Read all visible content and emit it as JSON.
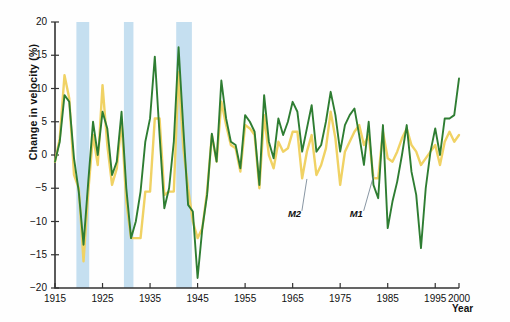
{
  "chart_data": {
    "type": "line",
    "title": "",
    "xlabel": "Year",
    "ylabel": "Change in velocity (%)",
    "xlim": [
      1915,
      2000
    ],
    "ylim": [
      -20,
      20
    ],
    "grid": false,
    "legend_position": "inline-annotation",
    "x_ticks": [
      "1915",
      "1925",
      "1935",
      "1945",
      "1955",
      "1965",
      "1975",
      "1985",
      "1995",
      "2000"
    ],
    "x_tick_values": [
      1915,
      1925,
      1935,
      1945,
      1955,
      1965,
      1975,
      1985,
      1995,
      2000
    ],
    "y_ticks": [
      "20",
      "15",
      "10",
      "5",
      "0",
      "-5",
      "-10",
      "-15",
      "-20"
    ],
    "y_tick_values": [
      20,
      15,
      10,
      5,
      0,
      -5,
      -10,
      -15,
      -20
    ],
    "colors": {
      "M1": "#2e7d32",
      "M2": "#f0d264",
      "recession_band": "#c5dff0",
      "axis": "#333333",
      "text": "#111111"
    },
    "annotations": [
      {
        "text": "M2",
        "x": 1964,
        "y": -9.0,
        "leader_to_x": 1968,
        "leader_to_y": -3.6
      },
      {
        "text": "M1",
        "x": 1977,
        "y": -9.0,
        "leader_to_x": 1982,
        "leader_to_y": -3.2
      }
    ],
    "shaded_bands": [
      {
        "x0": 1919.5,
        "x1": 1922.2,
        "label": ""
      },
      {
        "x0": 1929.5,
        "x1": 1931.5,
        "label": ""
      },
      {
        "x0": 1940.5,
        "x1": 1943.8,
        "label": ""
      }
    ],
    "x": [
      1915,
      1916,
      1917,
      1918,
      1919,
      1920,
      1921,
      1922,
      1923,
      1924,
      1925,
      1926,
      1927,
      1928,
      1929,
      1930,
      1931,
      1932,
      1933,
      1934,
      1935,
      1936,
      1937,
      1938,
      1939,
      1940,
      1941,
      1942,
      1943,
      1944,
      1945,
      1946,
      1947,
      1948,
      1949,
      1950,
      1951,
      1952,
      1953,
      1954,
      1955,
      1956,
      1957,
      1958,
      1959,
      1960,
      1961,
      1962,
      1963,
      1964,
      1965,
      1966,
      1967,
      1968,
      1969,
      1970,
      1971,
      1972,
      1973,
      1974,
      1975,
      1976,
      1977,
      1978,
      1979,
      1980,
      1981,
      1982,
      1983,
      1984,
      1985,
      1986,
      1987,
      1988,
      1989,
      1990,
      1991,
      1992,
      1993,
      1994,
      1995,
      1996,
      1997,
      1998,
      1999,
      2000
    ],
    "series": [
      {
        "name": "M1",
        "color": "#2e7d32",
        "values": [
          -1.0,
          2.0,
          9.0,
          8.0,
          -0.5,
          -5.5,
          -13.5,
          -4.0,
          5.0,
          0.0,
          6.5,
          4.0,
          -3.0,
          -1.0,
          6.5,
          -5.0,
          -12.5,
          -10.0,
          -5.5,
          2.0,
          5.5,
          14.8,
          3.0,
          -8.0,
          -5.0,
          2.0,
          16.2,
          4.0,
          -7.5,
          -8.5,
          -18.5,
          -11.0,
          -6.0,
          3.2,
          -1.0,
          11.2,
          5.5,
          2.0,
          1.5,
          -2.0,
          6.0,
          5.0,
          3.5,
          -4.5,
          9.0,
          2.0,
          -0.5,
          5.5,
          3.0,
          5.0,
          8.0,
          6.5,
          0.5,
          4.0,
          7.5,
          0.5,
          1.5,
          5.0,
          9.5,
          6.0,
          0.5,
          4.5,
          6.0,
          7.0,
          3.0,
          -1.5,
          5.0,
          -4.5,
          -6.5,
          4.5,
          -11.0,
          -7.0,
          -4.0,
          0.0,
          4.5,
          -2.5,
          -6.0,
          -14.0,
          -5.0,
          0.5,
          4.0,
          0.0,
          5.5,
          5.5,
          6.0,
          11.5
        ]
      },
      {
        "name": "M2",
        "color": "#f0d264",
        "values": [
          -1.0,
          2.5,
          12.0,
          8.5,
          -3.0,
          -5.0,
          -16.0,
          -5.5,
          3.0,
          -1.5,
          10.5,
          1.5,
          -4.5,
          -2.0,
          5.0,
          -7.0,
          -12.5,
          -12.5,
          -12.5,
          -5.5,
          -5.5,
          5.5,
          5.5,
          -6.0,
          -5.5,
          -5.5,
          12.5,
          1.0,
          -5.0,
          -10.0,
          -12.5,
          -11.0,
          -5.5,
          3.0,
          -1.0,
          8.0,
          4.5,
          1.5,
          1.0,
          -2.5,
          4.5,
          4.0,
          3.0,
          -5.0,
          6.0,
          0.0,
          -2.0,
          2.0,
          0.5,
          1.0,
          3.5,
          3.5,
          -3.5,
          0.5,
          3.0,
          -3.0,
          -1.5,
          1.0,
          6.5,
          2.5,
          -4.5,
          0.5,
          2.0,
          3.5,
          4.5,
          1.5,
          3.0,
          -3.5,
          -3.5,
          3.5,
          -0.5,
          -1.0,
          0.5,
          2.5,
          4.0,
          1.5,
          0.5,
          -1.5,
          -0.5,
          0.5,
          1.5,
          -1.5,
          2.0,
          3.5,
          2.0,
          3.0
        ]
      }
    ]
  },
  "axis": {
    "y_title": "Change in velocity (%)",
    "x_title": "Year"
  }
}
